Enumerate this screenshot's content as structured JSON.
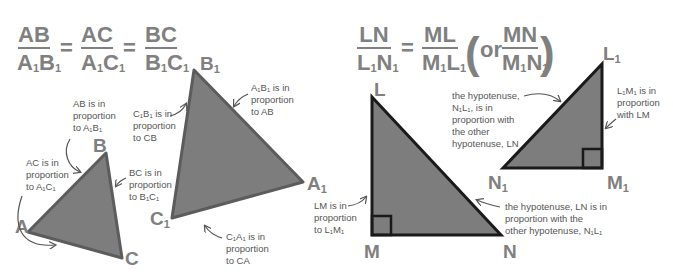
{
  "colors": {
    "formula_gray": "#808080",
    "label_gray": "#808080",
    "note_text": "#555555",
    "triangle_fill": "#7d7d7d",
    "triangle_stroke_similar": "#5c5c5c",
    "triangle_stroke_right": "#1a1a1a",
    "arrow": "#555555"
  },
  "left_formula": {
    "fractions": [
      {
        "num": "AB",
        "den_a": "A",
        "den_a_sub": "1",
        "den_b": "B",
        "den_b_sub": "1"
      },
      {
        "num": "AC",
        "den_a": "A",
        "den_a_sub": "1",
        "den_b": "C",
        "den_b_sub": "1"
      },
      {
        "num": "BC",
        "den_a": "B",
        "den_a_sub": "1",
        "den_b": "C",
        "den_b_sub": "1"
      }
    ],
    "equals": "="
  },
  "right_formula": {
    "fractions": [
      {
        "num": "LN",
        "den_a": "L",
        "den_a_sub": "1",
        "den_b": "N",
        "den_b_sub": "1"
      },
      {
        "num": "ML",
        "den_a": "M",
        "den_a_sub": "1",
        "den_b": "L",
        "den_b_sub": "1"
      },
      {
        "num": "MN",
        "den_a": "M",
        "den_a_sub": "1",
        "den_b": "N",
        "den_b_sub": "1"
      }
    ],
    "equals": "=",
    "or": "or",
    "open_paren": "(",
    "close_paren": ")"
  },
  "small_triangle": {
    "vertices": {
      "A": "A",
      "B": "B",
      "C": "C"
    },
    "notes": {
      "ab": [
        "AB is in",
        "proportion",
        "to A₁B₁"
      ],
      "ac": [
        "AC is in",
        "proportion",
        "to A₁C₁"
      ],
      "bc": [
        "BC is in",
        "proportion",
        "to B₁C₁"
      ]
    }
  },
  "large_triangle": {
    "vertices": {
      "A1": "A",
      "B1": "B",
      "C1": "C",
      "sub": "1"
    },
    "notes": {
      "c1b1": [
        "C₁B₁ is in",
        "proportion",
        "to CB"
      ],
      "a1b1": [
        "A₁B₁ is in",
        "proportion",
        "to AB"
      ],
      "c1a1": [
        "C₁A₁ is in",
        "proportion",
        "to CA"
      ]
    }
  },
  "big_right_triangle": {
    "vertices": {
      "L": "L",
      "M": "M",
      "N": "N"
    },
    "notes": {
      "lm": [
        "LM is in",
        "proportion",
        "to L₁M₁"
      ],
      "ln": [
        "the hypotenuse, LN is in",
        "proportion with the",
        "other hypotenuse, N₁L₁"
      ]
    }
  },
  "small_right_triangle": {
    "vertices": {
      "L1": "L",
      "M1": "M",
      "N1": "N",
      "sub": "1"
    },
    "notes": {
      "n1l1": [
        "the hypotenuse,",
        "N₁L₁, is in",
        "proportion with",
        "the other",
        "hypotenuse, LN"
      ],
      "l1m1": [
        "L₁M₁ is in",
        "proportion",
        "with LM"
      ]
    }
  }
}
